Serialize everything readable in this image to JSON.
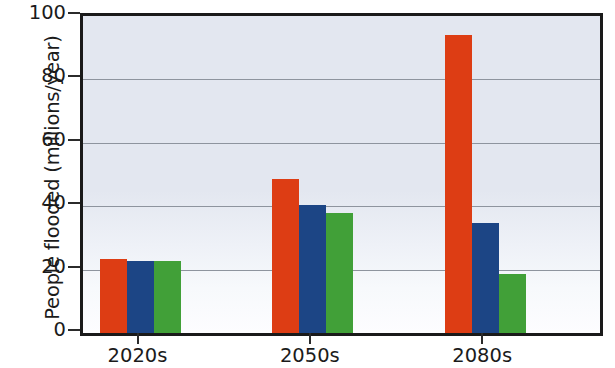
{
  "chart_data": {
    "type": "bar",
    "title": "",
    "subtitle": "",
    "xlabel": "",
    "ylabel": "People flooded (millions/year)",
    "categories": [
      "2020s",
      "2050s",
      "2080s"
    ],
    "series": [
      {
        "name": "red-series",
        "color": "#dd3d14",
        "values": [
          23.4,
          48.7,
          94.0
        ]
      },
      {
        "name": "blue-series",
        "color": "#1c4585",
        "values": [
          22.8,
          40.3,
          34.6
        ]
      },
      {
        "name": "green-series",
        "color": "#41a038",
        "values": [
          22.6,
          38.0,
          18.6
        ]
      }
    ],
    "ylim": [
      0,
      100
    ],
    "yticks": [
      0,
      20,
      40,
      60,
      80,
      100
    ],
    "ytick_labels": [
      "0",
      "20",
      "40",
      "60",
      "80",
      "100"
    ],
    "xtick_labels": [
      "2020s",
      "2050s",
      "2080s"
    ],
    "grid": true,
    "grid_axis": "y",
    "legend": "none",
    "legend_position": "none",
    "annotations": [],
    "plot_background": "#e3e7f0",
    "gridline_color": "#8e949e",
    "axis_color": "#1a1a1a"
  },
  "axis": {
    "y_title": "People flooded (millions/year)",
    "y_ticks": [
      {
        "value": 100,
        "label": "100"
      },
      {
        "value": 80,
        "label": "80"
      },
      {
        "value": 60,
        "label": "60"
      },
      {
        "value": 40,
        "label": "40"
      },
      {
        "value": 20,
        "label": "20"
      },
      {
        "value": 0,
        "label": "0"
      }
    ],
    "x_ticks": [
      {
        "label": "2020s"
      },
      {
        "label": "2050s"
      },
      {
        "label": "2080s"
      }
    ]
  }
}
